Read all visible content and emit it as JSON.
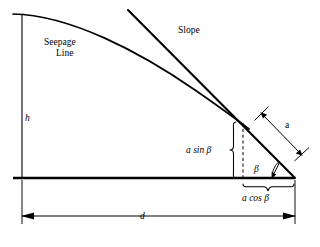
{
  "figure": {
    "kind": "geotechnical-slope-seepage-diagram",
    "background_color": "#ffffff",
    "ink_color": "#000000",
    "labels": {
      "seepage_line_1": "Seepage",
      "seepage_line_2": "Line",
      "slope": "Slope",
      "height_h": "h",
      "distance_d": "d",
      "segment_a": "a",
      "a_sin_beta": "a sin β",
      "a_cos_beta": "a cos β",
      "beta": "β"
    },
    "geometry": {
      "ground_line": {
        "x1": 13,
        "y1": 178,
        "x2": 295,
        "y2": 178
      },
      "left_vertical": {
        "x1": 22,
        "y1": 14,
        "x2": 22,
        "y2": 178
      },
      "seepage_curve": {
        "start_x": 13,
        "start_y": 14,
        "end_x": 248,
        "end_y": 129
      },
      "slope_line": {
        "x1": 128,
        "y1": 10,
        "x2": 295,
        "y2": 178
      },
      "dashed_drop": {
        "x": 243,
        "y1": 123,
        "y2": 178
      },
      "toe_point": {
        "x": 295,
        "y": 178
      },
      "exit_point": {
        "x": 243,
        "y": 123
      },
      "a_dimension": {
        "x1": 258,
        "y1": 110,
        "x2": 305,
        "y2": 158
      },
      "d_dimension": {
        "x1": 22,
        "y1": 216,
        "x2": 295,
        "y2": 216
      },
      "beta_angle_degrees": 45
    }
  }
}
